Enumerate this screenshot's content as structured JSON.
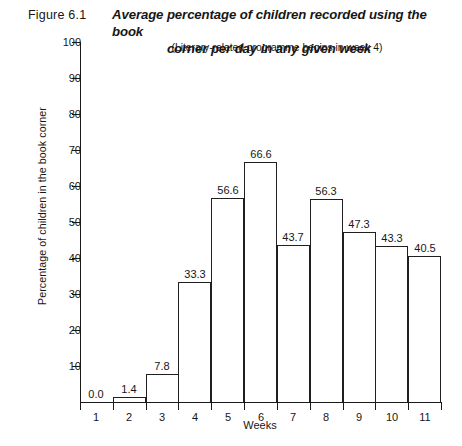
{
  "figure": {
    "number": "Figure 6.1",
    "title_line1": "Average percentage of children recorded using the book",
    "title_line2": "corner per day in any given week",
    "subtitle": "(Literary-related programme begins in week 4)"
  },
  "chart_data": {
    "type": "bar",
    "title": "Average percentage of children recorded using the book corner per day in any given week",
    "subtitle": "(Literary-related programme begins in week 4)",
    "xlabel": "Weeks",
    "ylabel": "Percentage of children in the book corner",
    "categories": [
      "1",
      "2",
      "3",
      "4",
      "5",
      "6",
      "7",
      "8",
      "9",
      "10",
      "11"
    ],
    "values": [
      0.0,
      1.4,
      7.8,
      33.3,
      56.6,
      66.6,
      43.7,
      56.3,
      47.3,
      43.3,
      40.5
    ],
    "value_labels": [
      "0.0",
      "1.4",
      "7.8",
      "33.3",
      "56.6",
      "66.6",
      "43.7",
      "56.3",
      "47.3",
      "43.3",
      "40.5"
    ],
    "ylim": [
      0,
      100
    ],
    "ytick_values": [
      10,
      20,
      30,
      40,
      50,
      60,
      70,
      80,
      90,
      100
    ],
    "ytick_labels": [
      "10",
      "20",
      "30",
      "40",
      "50",
      "60",
      "70",
      "80",
      "90",
      "100"
    ],
    "grid": false,
    "legend": null,
    "bar_fill": "#ffffff",
    "bar_stroke": "#1f1f1f",
    "axis_color": "#1a1a1a"
  }
}
